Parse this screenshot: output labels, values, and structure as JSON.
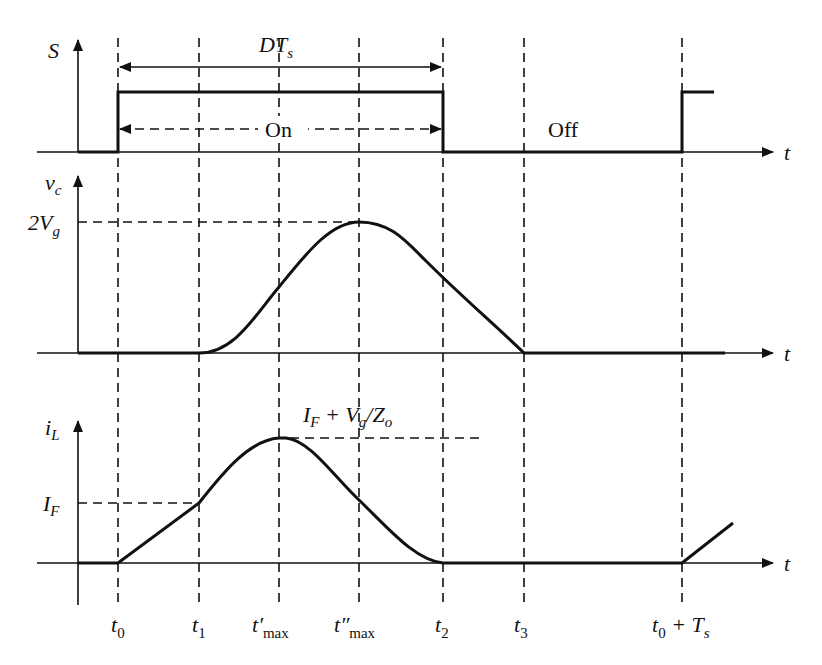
{
  "diagram": {
    "ink_color": "#111111",
    "background": "#ffffff",
    "time_markers": [
      {
        "id": "t0",
        "x": 118,
        "label": "t",
        "sub": "0",
        "prime": ""
      },
      {
        "id": "t1",
        "x": 199,
        "label": "t",
        "sub": "1",
        "prime": ""
      },
      {
        "id": "tmax1",
        "x": 279,
        "label": "t",
        "sub": "max",
        "prime": "′"
      },
      {
        "id": "tmax2",
        "x": 359,
        "label": "t",
        "sub": "max",
        "prime": "″"
      },
      {
        "id": "t2",
        "x": 443,
        "label": "t",
        "sub": "2",
        "prime": ""
      },
      {
        "id": "t3",
        "x": 524,
        "label": "t",
        "sub": "3",
        "prime": ""
      },
      {
        "id": "t0Ts",
        "x": 682,
        "label": "t",
        "sub": "0",
        "suffix": " + T",
        "suffix_sub": "s"
      }
    ],
    "panels": {
      "switch": {
        "axis_label": "S",
        "time_axis_label": "t",
        "duty_label_main": "DT",
        "duty_label_sub": "s",
        "on_label": "On",
        "off_label": "Off"
      },
      "capacitor_voltage": {
        "axis_label_main": "v",
        "axis_label_sub": "c",
        "time_axis_label": "t",
        "peak_label_main": "2V",
        "peak_label_sub": "g"
      },
      "inductor_current": {
        "axis_label_main": "i",
        "axis_label_sub": "L",
        "time_axis_label": "t",
        "level_label_main": "I",
        "level_label_sub": "F",
        "peak_label": {
          "p1": "I",
          "p1_sub": "F",
          "p2": " + V",
          "p2_sub": "g",
          "p3": "/Z",
          "p3_sub": "o"
        }
      }
    }
  }
}
